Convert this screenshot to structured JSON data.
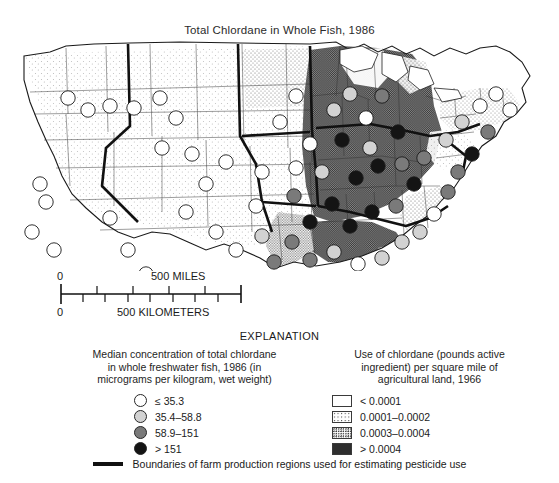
{
  "title": "Total Chlordane in Whole Fish, 1986",
  "explanation_label": "EXPLANATION",
  "scale": {
    "miles_zero": "0",
    "miles_label": "500 MILES",
    "km_zero": "0",
    "km_label": "500 KILOMETERS"
  },
  "legend_left": {
    "heading_line1": "Median concentration of total chlordane",
    "heading_line2": "in whole freshwater fish, 1986 (in",
    "heading_line3": "micrograms per kilogram, wet weight)",
    "items": [
      {
        "label": "≤ 35.3",
        "color": "#ffffff"
      },
      {
        "label": "35.4–58.8",
        "color": "#d2d2d2"
      },
      {
        "label": "58.9–151",
        "color": "#7a7a7a"
      },
      {
        "label": "> 151",
        "color": "#141414"
      }
    ]
  },
  "legend_right": {
    "heading_line1": "Use of chlordane (pounds active",
    "heading_line2": "ingredient) per square mile of",
    "heading_line3": "agricultural land, 1966",
    "items": [
      {
        "label": "< 0.0001",
        "pattern": "stip1"
      },
      {
        "label": "0.0001–0.0002",
        "pattern": "stip2"
      },
      {
        "label": "0.0003–0.0004",
        "pattern": "stip3"
      },
      {
        "label": "> 0.0004",
        "pattern": "stip4"
      }
    ]
  },
  "boundary_note": "Boundaries of farm production regions used for estimating pesticide use",
  "chart_data": {
    "type": "map",
    "title": "Total Chlordane in Whole Fish, 1986",
    "region": "Conterminous United States",
    "symbol_variable": "Median concentration of total chlordane in whole freshwater fish, 1986 (micrograms per kilogram, wet weight)",
    "symbol_classes": [
      "≤ 35.3",
      "35.4–58.8",
      "58.9–151",
      "> 151"
    ],
    "area_variable": "Use of chlordane (pounds active ingredient) per square mile of agricultural land, 1966",
    "area_classes": [
      "< 0.0001",
      "0.0001–0.0002",
      "0.0003–0.0004",
      "> 0.0004"
    ],
    "overlay": "Boundaries of farm production regions used for estimating pesticide use",
    "scale_bar": [
      "500 MILES",
      "500 KILOMETERS"
    ],
    "sites": [
      {
        "x": 30,
        "y": 148,
        "class": 0
      },
      {
        "x": 36,
        "y": 166,
        "class": 0
      },
      {
        "x": 22,
        "y": 196,
        "class": 0
      },
      {
        "x": 44,
        "y": 214,
        "class": 0
      },
      {
        "x": 58,
        "y": 62,
        "class": 0
      },
      {
        "x": 78,
        "y": 74,
        "class": 0
      },
      {
        "x": 100,
        "y": 70,
        "class": 0
      },
      {
        "x": 124,
        "y": 72,
        "class": 0
      },
      {
        "x": 150,
        "y": 62,
        "class": 0
      },
      {
        "x": 166,
        "y": 82,
        "class": 0
      },
      {
        "x": 152,
        "y": 112,
        "class": 0
      },
      {
        "x": 182,
        "y": 118,
        "class": 0
      },
      {
        "x": 196,
        "y": 148,
        "class": 0
      },
      {
        "x": 216,
        "y": 126,
        "class": 0
      },
      {
        "x": 100,
        "y": 182,
        "class": 0
      },
      {
        "x": 118,
        "y": 214,
        "class": 0
      },
      {
        "x": 136,
        "y": 238,
        "class": 0
      },
      {
        "x": 176,
        "y": 176,
        "class": 0
      },
      {
        "x": 206,
        "y": 196,
        "class": 0
      },
      {
        "x": 226,
        "y": 214,
        "class": 0
      },
      {
        "x": 246,
        "y": 170,
        "class": 0
      },
      {
        "x": 252,
        "y": 136,
        "class": 0
      },
      {
        "x": 270,
        "y": 86,
        "class": 0
      },
      {
        "x": 286,
        "y": 60,
        "class": 0
      },
      {
        "x": 300,
        "y": 108,
        "class": 0
      },
      {
        "x": 312,
        "y": 136,
        "class": 1
      },
      {
        "x": 286,
        "y": 132,
        "class": 0
      },
      {
        "x": 324,
        "y": 74,
        "class": 1
      },
      {
        "x": 340,
        "y": 58,
        "class": 1
      },
      {
        "x": 356,
        "y": 82,
        "class": 0
      },
      {
        "x": 372,
        "y": 60,
        "class": 2
      },
      {
        "x": 388,
        "y": 96,
        "class": 3
      },
      {
        "x": 360,
        "y": 112,
        "class": 1
      },
      {
        "x": 332,
        "y": 104,
        "class": 3
      },
      {
        "x": 346,
        "y": 142,
        "class": 3
      },
      {
        "x": 368,
        "y": 130,
        "class": 3
      },
      {
        "x": 392,
        "y": 128,
        "class": 2
      },
      {
        "x": 404,
        "y": 148,
        "class": 3
      },
      {
        "x": 322,
        "y": 168,
        "class": 3
      },
      {
        "x": 300,
        "y": 186,
        "class": 3
      },
      {
        "x": 284,
        "y": 160,
        "class": 2
      },
      {
        "x": 340,
        "y": 190,
        "class": 3
      },
      {
        "x": 362,
        "y": 176,
        "class": 3
      },
      {
        "x": 386,
        "y": 170,
        "class": 2
      },
      {
        "x": 414,
        "y": 122,
        "class": 2
      },
      {
        "x": 436,
        "y": 104,
        "class": 1
      },
      {
        "x": 452,
        "y": 86,
        "class": 1
      },
      {
        "x": 470,
        "y": 70,
        "class": 0
      },
      {
        "x": 486,
        "y": 58,
        "class": 0
      },
      {
        "x": 500,
        "y": 74,
        "class": 0
      },
      {
        "x": 478,
        "y": 96,
        "class": 2
      },
      {
        "x": 462,
        "y": 118,
        "class": 3
      },
      {
        "x": 448,
        "y": 136,
        "class": 2
      },
      {
        "x": 438,
        "y": 156,
        "class": 2
      },
      {
        "x": 424,
        "y": 178,
        "class": 0
      },
      {
        "x": 410,
        "y": 196,
        "class": 1
      },
      {
        "x": 392,
        "y": 206,
        "class": 1
      },
      {
        "x": 372,
        "y": 222,
        "class": 1
      },
      {
        "x": 348,
        "y": 228,
        "class": 0
      },
      {
        "x": 324,
        "y": 216,
        "class": 1
      },
      {
        "x": 300,
        "y": 224,
        "class": 2
      },
      {
        "x": 282,
        "y": 206,
        "class": 2
      },
      {
        "x": 264,
        "y": 226,
        "class": 2
      },
      {
        "x": 252,
        "y": 200,
        "class": 1
      }
    ]
  }
}
